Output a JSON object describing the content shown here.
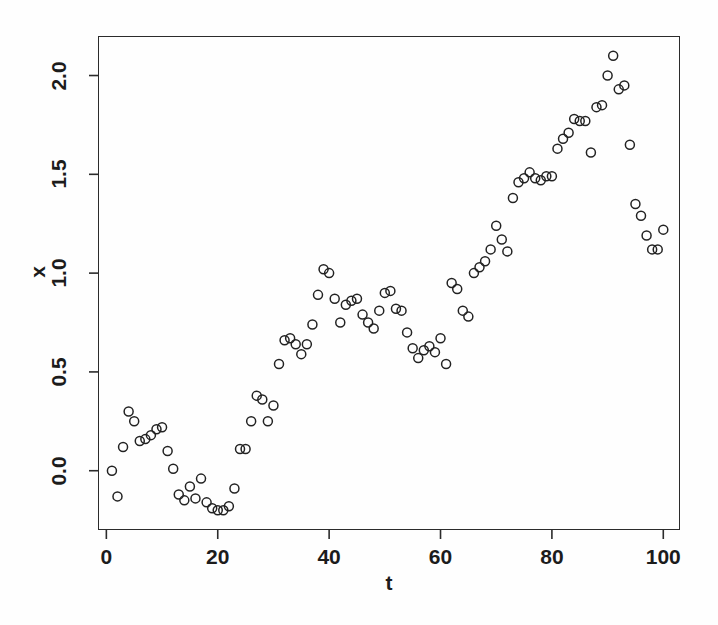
{
  "chart_data": {
    "type": "scatter",
    "title": "",
    "subtitle": "",
    "xlabel": "t",
    "ylabel": "x",
    "xlim": [
      -1.5,
      103.0
    ],
    "ylim": [
      -0.3,
      2.2
    ],
    "xticks": [
      0,
      20,
      40,
      60,
      80,
      100
    ],
    "xtick_labels": [
      "0",
      "20",
      "40",
      "60",
      "80",
      "100"
    ],
    "yticks": [
      0.0,
      0.5,
      1.0,
      1.5,
      2.0
    ],
    "ytick_labels": [
      "0.0",
      "0.5",
      "1.0",
      "1.5",
      "2.0"
    ],
    "grid": false,
    "legend": false,
    "legend_position": "none",
    "marker": "open-circle",
    "marker_size_px": 9,
    "marker_stroke_px": 1.5,
    "marker_color": "#222222",
    "marker_fill": "none",
    "frame": true,
    "n_points": 100,
    "x": [
      1,
      2,
      3,
      4,
      5,
      6,
      7,
      8,
      9,
      10,
      11,
      12,
      13,
      14,
      15,
      16,
      17,
      18,
      19,
      20,
      21,
      22,
      23,
      24,
      25,
      26,
      27,
      28,
      29,
      30,
      31,
      32,
      33,
      34,
      35,
      36,
      37,
      38,
      39,
      40,
      41,
      42,
      43,
      44,
      45,
      46,
      47,
      48,
      49,
      50,
      51,
      52,
      53,
      54,
      55,
      56,
      57,
      58,
      59,
      60,
      61,
      62,
      63,
      64,
      65,
      66,
      67,
      68,
      69,
      70,
      71,
      72,
      73,
      74,
      75,
      76,
      77,
      78,
      79,
      80,
      81,
      82,
      83,
      84,
      85,
      86,
      87,
      88,
      89,
      90,
      91,
      92,
      93,
      94,
      95,
      96,
      97,
      98,
      99,
      100
    ],
    "y": [
      0.0,
      -0.13,
      0.12,
      0.3,
      0.25,
      0.15,
      0.16,
      0.18,
      0.21,
      0.22,
      0.1,
      0.01,
      -0.12,
      -0.15,
      -0.08,
      -0.14,
      -0.04,
      -0.16,
      -0.19,
      -0.2,
      -0.2,
      -0.18,
      -0.09,
      0.11,
      0.11,
      0.25,
      0.38,
      0.36,
      0.25,
      0.33,
      0.54,
      0.66,
      0.67,
      0.64,
      0.59,
      0.64,
      0.74,
      0.89,
      1.02,
      1.0,
      0.87,
      0.75,
      0.84,
      0.86,
      0.87,
      0.79,
      0.75,
      0.72,
      0.81,
      0.9,
      0.91,
      0.82,
      0.81,
      0.7,
      0.62,
      0.57,
      0.61,
      0.63,
      0.6,
      0.67,
      0.54,
      0.95,
      0.92,
      0.81,
      0.78,
      1.0,
      1.03,
      1.06,
      1.12,
      1.24,
      1.17,
      1.11,
      1.38,
      1.46,
      1.48,
      1.51,
      1.48,
      1.47,
      1.49,
      1.49,
      1.63,
      1.68,
      1.71,
      1.78,
      1.77,
      1.77,
      1.61,
      1.84,
      1.85,
      2.0,
      2.1,
      1.93,
      1.95,
      1.65,
      1.35,
      1.29,
      1.19,
      1.12,
      1.12,
      1.22
    ],
    "points": [
      {
        "t": 1,
        "x": 0.0
      },
      {
        "t": 2,
        "x": -0.13
      },
      {
        "t": 3,
        "x": 0.12
      },
      {
        "t": 4,
        "x": 0.3
      },
      {
        "t": 5,
        "x": 0.25
      },
      {
        "t": 6,
        "x": 0.15
      },
      {
        "t": 7,
        "x": 0.16
      },
      {
        "t": 8,
        "x": 0.18
      },
      {
        "t": 9,
        "x": 0.21
      },
      {
        "t": 10,
        "x": 0.22
      },
      {
        "t": 11,
        "x": 0.1
      },
      {
        "t": 12,
        "x": 0.01
      },
      {
        "t": 13,
        "x": -0.12
      },
      {
        "t": 14,
        "x": -0.15
      },
      {
        "t": 15,
        "x": -0.08
      },
      {
        "t": 16,
        "x": -0.14
      },
      {
        "t": 17,
        "x": -0.04
      },
      {
        "t": 18,
        "x": -0.16
      },
      {
        "t": 19,
        "x": -0.19
      },
      {
        "t": 20,
        "x": -0.2
      },
      {
        "t": 21,
        "x": -0.2
      },
      {
        "t": 22,
        "x": -0.18
      },
      {
        "t": 23,
        "x": -0.09
      },
      {
        "t": 24,
        "x": 0.11
      },
      {
        "t": 25,
        "x": 0.11
      },
      {
        "t": 26,
        "x": 0.25
      },
      {
        "t": 27,
        "x": 0.38
      },
      {
        "t": 28,
        "x": 0.36
      },
      {
        "t": 29,
        "x": 0.25
      },
      {
        "t": 30,
        "x": 0.33
      },
      {
        "t": 31,
        "x": 0.54
      },
      {
        "t": 32,
        "x": 0.66
      },
      {
        "t": 33,
        "x": 0.67
      },
      {
        "t": 34,
        "x": 0.64
      },
      {
        "t": 35,
        "x": 0.59
      },
      {
        "t": 36,
        "x": 0.64
      },
      {
        "t": 37,
        "x": 0.74
      },
      {
        "t": 38,
        "x": 0.89
      },
      {
        "t": 39,
        "x": 1.02
      },
      {
        "t": 40,
        "x": 1.0
      },
      {
        "t": 41,
        "x": 0.87
      },
      {
        "t": 42,
        "x": 0.75
      },
      {
        "t": 43,
        "x": 0.84
      },
      {
        "t": 44,
        "x": 0.86
      },
      {
        "t": 45,
        "x": 0.87
      },
      {
        "t": 46,
        "x": 0.79
      },
      {
        "t": 47,
        "x": 0.75
      },
      {
        "t": 48,
        "x": 0.72
      },
      {
        "t": 49,
        "x": 0.81
      },
      {
        "t": 50,
        "x": 0.9
      },
      {
        "t": 51,
        "x": 0.91
      },
      {
        "t": 52,
        "x": 0.82
      },
      {
        "t": 53,
        "x": 0.81
      },
      {
        "t": 54,
        "x": 0.7
      },
      {
        "t": 55,
        "x": 0.62
      },
      {
        "t": 56,
        "x": 0.57
      },
      {
        "t": 57,
        "x": 0.61
      },
      {
        "t": 58,
        "x": 0.63
      },
      {
        "t": 59,
        "x": 0.6
      },
      {
        "t": 60,
        "x": 0.67
      },
      {
        "t": 61,
        "x": 0.54
      },
      {
        "t": 62,
        "x": 0.95
      },
      {
        "t": 63,
        "x": 0.92
      },
      {
        "t": 64,
        "x": 0.81
      },
      {
        "t": 65,
        "x": 0.78
      },
      {
        "t": 66,
        "x": 1.0
      },
      {
        "t": 67,
        "x": 1.03
      },
      {
        "t": 68,
        "x": 1.06
      },
      {
        "t": 69,
        "x": 1.12
      },
      {
        "t": 70,
        "x": 1.24
      },
      {
        "t": 71,
        "x": 1.17
      },
      {
        "t": 72,
        "x": 1.11
      },
      {
        "t": 73,
        "x": 1.38
      },
      {
        "t": 74,
        "x": 1.46
      },
      {
        "t": 75,
        "x": 1.48
      },
      {
        "t": 76,
        "x": 1.51
      },
      {
        "t": 77,
        "x": 1.48
      },
      {
        "t": 78,
        "x": 1.47
      },
      {
        "t": 79,
        "x": 1.49
      },
      {
        "t": 80,
        "x": 1.49
      },
      {
        "t": 81,
        "x": 1.63
      },
      {
        "t": 82,
        "x": 1.68
      },
      {
        "t": 83,
        "x": 1.71
      },
      {
        "t": 84,
        "x": 1.78
      },
      {
        "t": 85,
        "x": 1.77
      },
      {
        "t": 86,
        "x": 1.77
      },
      {
        "t": 87,
        "x": 1.61
      },
      {
        "t": 88,
        "x": 1.84
      },
      {
        "t": 89,
        "x": 1.85
      },
      {
        "t": 90,
        "x": 2.0
      },
      {
        "t": 91,
        "x": 2.1
      },
      {
        "t": 92,
        "x": 1.93
      },
      {
        "t": 93,
        "x": 1.95
      },
      {
        "t": 94,
        "x": 1.65
      },
      {
        "t": 95,
        "x": 1.35
      },
      {
        "t": 96,
        "x": 1.29
      },
      {
        "t": 97,
        "x": 1.19
      },
      {
        "t": 98,
        "x": 1.12
      },
      {
        "t": 99,
        "x": 1.12
      },
      {
        "t": 100,
        "x": 1.22
      }
    ],
    "colors": {
      "axis": "#2b2b2b",
      "marker": "#222222",
      "background": "#fefefe",
      "text": "#1c1c1c"
    }
  },
  "axes": {
    "x_title": "t",
    "y_title": "x"
  }
}
